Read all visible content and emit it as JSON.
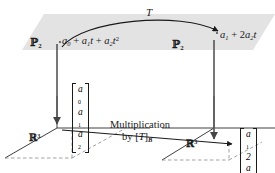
{
  "figure": {
    "name": "commutative-diagram-linear-transformation-coordinate-vectors",
    "domain_label_left": "P2",
    "domain_label_right": "P2",
    "transformation_label": "T",
    "top_left_element": "a0 + a1t + a2t^2",
    "top_right_element": "a1 + 2a2t",
    "bottom_left_space": "R3",
    "bottom_right_space": "R3",
    "bottom_arrow_caption_line1": "Multiplication",
    "bottom_arrow_caption_line2": "by [T]B",
    "left_vector": [
      "a0",
      "a1",
      "a2"
    ],
    "right_vector": [
      "a1",
      "2a2",
      "0"
    ],
    "colors": {
      "plane_fill": "#e2e2e2",
      "stroke": "#1a1a1a",
      "arrow_gray": "#5a5a5a",
      "dashed": "#7a7a7a"
    }
  }
}
